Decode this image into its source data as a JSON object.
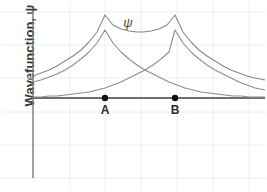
{
  "figure": {
    "type": "line-plot",
    "background": "#ffffff",
    "width": 267,
    "height": 192
  },
  "axes": {
    "y_axis_label": "Wavefunction, ψ",
    "y_axis_color": "#777777",
    "baseline_color": "#6f6f6f",
    "grid": {
      "visible": true,
      "color": "#eceef0",
      "x_lines": [
        70,
        105,
        141,
        177,
        213,
        249
      ],
      "y_lines": [
        12,
        45,
        78,
        112,
        145,
        178
      ]
    },
    "origin_x": 33,
    "baseline_y": 98,
    "axis_top_y": 10,
    "axis_bottom_y": 178,
    "plot_right_x": 265
  },
  "annotations": {
    "psi": "ψ",
    "psi_x": 128,
    "psi_y": 15,
    "point_a_label": "A",
    "point_b_label": "B",
    "point_color": "#111111"
  },
  "chart_data": {
    "type": "line",
    "title": "",
    "xlabel": "",
    "ylabel": "Wavefunction, ψ",
    "grid": true,
    "legend": "none",
    "xlim": [
      33,
      265
    ],
    "ylim_pixels": [
      178,
      10
    ],
    "nuclei": [
      {
        "name": "A",
        "x": 105,
        "y": 98
      },
      {
        "name": "B",
        "x": 175,
        "y": 98
      }
    ],
    "annotation_labels": [
      "ψ",
      "A",
      "B"
    ],
    "series": [
      {
        "name": "molecular-orbital-sum",
        "description": "Bonding molecular orbital ψ = ψA + ψB (upper curve, cusps at A and B)",
        "color": "#888888",
        "points": [
          [
            33,
            76
          ],
          [
            41,
            73
          ],
          [
            49,
            70
          ],
          [
            57,
            66
          ],
          [
            65,
            61
          ],
          [
            73,
            56
          ],
          [
            81,
            50
          ],
          [
            89,
            42
          ],
          [
            97,
            32
          ],
          [
            105,
            15
          ],
          [
            113,
            25
          ],
          [
            121,
            29
          ],
          [
            129,
            31
          ],
          [
            137,
            32
          ],
          [
            140,
            32
          ],
          [
            143,
            32
          ],
          [
            151,
            31
          ],
          [
            159,
            29
          ],
          [
            167,
            25
          ],
          [
            175,
            15
          ],
          [
            183,
            32
          ],
          [
            191,
            42
          ],
          [
            199,
            50
          ],
          [
            207,
            56
          ],
          [
            215,
            61
          ],
          [
            223,
            66
          ],
          [
            231,
            70
          ],
          [
            239,
            73
          ],
          [
            247,
            76
          ],
          [
            255,
            78
          ],
          [
            265,
            80
          ]
        ]
      },
      {
        "name": "atomic-orbital-A",
        "description": "Atomic orbital centered on nucleus A, exponential decay",
        "color": "#8d8d8d",
        "points": [
          [
            33,
            82
          ],
          [
            41,
            80
          ],
          [
            49,
            77
          ],
          [
            57,
            74
          ],
          [
            65,
            70
          ],
          [
            73,
            65
          ],
          [
            81,
            59
          ],
          [
            89,
            52
          ],
          [
            97,
            43
          ],
          [
            105,
            30
          ],
          [
            113,
            43
          ],
          [
            121,
            52
          ],
          [
            129,
            59
          ],
          [
            137,
            65
          ],
          [
            145,
            70
          ],
          [
            153,
            74
          ],
          [
            161,
            78
          ],
          [
            169,
            82
          ],
          [
            177,
            85
          ],
          [
            185,
            88
          ],
          [
            193,
            90
          ],
          [
            201,
            92
          ],
          [
            209,
            93
          ],
          [
            217,
            94
          ],
          [
            225,
            95
          ],
          [
            233,
            96
          ],
          [
            241,
            96
          ],
          [
            249,
            97
          ],
          [
            257,
            97
          ],
          [
            265,
            97
          ]
        ]
      },
      {
        "name": "atomic-orbital-B",
        "description": "Atomic orbital centered on nucleus B, exponential decay",
        "color": "#8d8d8d",
        "points": [
          [
            33,
            97
          ],
          [
            41,
            97
          ],
          [
            49,
            96
          ],
          [
            57,
            96
          ],
          [
            65,
            95
          ],
          [
            73,
            94
          ],
          [
            81,
            93
          ],
          [
            89,
            92
          ],
          [
            97,
            90
          ],
          [
            105,
            88
          ],
          [
            113,
            85
          ],
          [
            121,
            82
          ],
          [
            129,
            78
          ],
          [
            137,
            74
          ],
          [
            145,
            70
          ],
          [
            153,
            65
          ],
          [
            161,
            59
          ],
          [
            169,
            52
          ],
          [
            175,
            30
          ],
          [
            183,
            43
          ],
          [
            191,
            52
          ],
          [
            199,
            59
          ],
          [
            207,
            65
          ],
          [
            215,
            70
          ],
          [
            223,
            74
          ],
          [
            231,
            78
          ],
          [
            239,
            82
          ],
          [
            247,
            85
          ],
          [
            255,
            88
          ],
          [
            265,
            90
          ]
        ]
      }
    ]
  }
}
